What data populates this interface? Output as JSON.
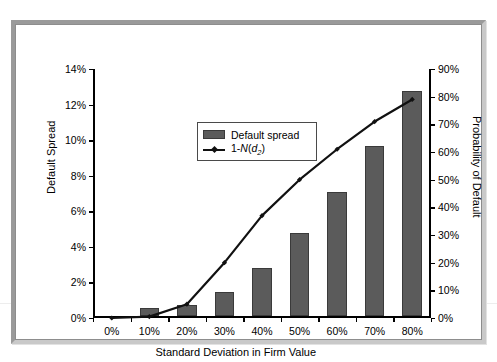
{
  "chart_data": {
    "type": "bar",
    "title": "",
    "xlabel": "Standard Deviation in Firm Value",
    "ylabel": "Default Spread",
    "y2label": "Probability of Default",
    "categories": [
      "0%",
      "10%",
      "20%",
      "30%",
      "40%",
      "50%",
      "60%",
      "70%",
      "80%"
    ],
    "x_values": [
      0,
      10,
      20,
      30,
      40,
      50,
      60,
      70,
      80
    ],
    "ylim": [
      0,
      14
    ],
    "y2lim": [
      0,
      90
    ],
    "y_ticks": [
      "0%",
      "2%",
      "4%",
      "6%",
      "8%",
      "10%",
      "12%",
      "14%"
    ],
    "y_tick_values": [
      0,
      2,
      4,
      6,
      8,
      10,
      12,
      14
    ],
    "y2_ticks": [
      "0%",
      "10%",
      "20%",
      "30%",
      "40%",
      "50%",
      "60%",
      "70%",
      "80%",
      "90%"
    ],
    "y2_tick_values": [
      0,
      10,
      20,
      30,
      40,
      50,
      60,
      70,
      80,
      90
    ],
    "grid": false,
    "legend_position": "upper left",
    "series": [
      {
        "name": "Default spread",
        "type": "bar",
        "axis": "left",
        "color": "#5b5b5b",
        "values": [
          0,
          0.45,
          0.65,
          1.4,
          2.75,
          4.7,
          7.0,
          9.6,
          12.7
        ]
      },
      {
        "name": "1-N(d2)",
        "type": "line",
        "axis": "right",
        "color": "#111111",
        "values": [
          0,
          0.5,
          5,
          20,
          37,
          50,
          61,
          71,
          79
        ]
      }
    ]
  },
  "legend": {
    "items": [
      {
        "label": "Default spread",
        "marker": "bar-swatch"
      },
      {
        "label": "1-N(d2)",
        "marker": "line-swatch"
      }
    ]
  },
  "colors": {
    "bar_fill": "#5b5b5b",
    "bar_edge": "#3a3a3a",
    "line": "#111111",
    "axis": "#000000",
    "frame_light": "#9a9a9a",
    "frame_dark": "#c9c9c9",
    "plot_background": "#ffffff"
  }
}
